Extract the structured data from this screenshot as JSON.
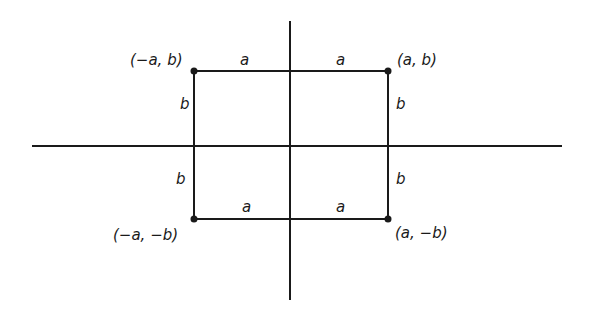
{
  "diagram": {
    "type": "coordinate-rectangle",
    "colors": {
      "line": "#1a1a1a",
      "background": "#ffffff"
    },
    "axes": {
      "horizontal": {
        "x1": 32,
        "x2": 562,
        "y": 146
      },
      "vertical": {
        "x": 290,
        "y1": 21,
        "y2": 300
      }
    },
    "rectangle": {
      "left": 194,
      "top": 71,
      "right": 388,
      "bottom": 219
    },
    "points": [
      {
        "id": "top-left",
        "label": "(−a, b)",
        "x": 194,
        "y": 71
      },
      {
        "id": "top-right",
        "label": "(a, b)",
        "x": 388,
        "y": 71
      },
      {
        "id": "bottom-left",
        "label": "(−a, −b)",
        "x": 194,
        "y": 219
      },
      {
        "id": "bottom-right",
        "label": "(a, −b)",
        "x": 388,
        "y": 219
      }
    ],
    "segment_labels": {
      "top_left_a": "a",
      "top_right_a": "a",
      "bottom_left_a": "a",
      "bottom_right_a": "a",
      "left_upper_b": "b",
      "left_lower_b": "b",
      "right_upper_b": "b",
      "right_lower_b": "b"
    }
  }
}
